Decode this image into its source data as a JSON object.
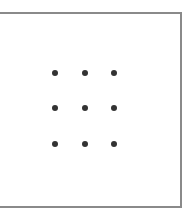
{
  "panel": {
    "border_color": "#8a8a8a",
    "background": "#ffffff"
  },
  "grid": {
    "rows": 3,
    "cols": 3,
    "dot_color": "#333333",
    "dots": [
      {
        "row": 0,
        "col": 0,
        "x": 55,
        "y": 73
      },
      {
        "row": 0,
        "col": 1,
        "x": 85,
        "y": 73
      },
      {
        "row": 0,
        "col": 2,
        "x": 114,
        "y": 73
      },
      {
        "row": 1,
        "col": 0,
        "x": 55,
        "y": 108
      },
      {
        "row": 1,
        "col": 1,
        "x": 85,
        "y": 108
      },
      {
        "row": 1,
        "col": 2,
        "x": 114,
        "y": 108
      },
      {
        "row": 2,
        "col": 0,
        "x": 55,
        "y": 144
      },
      {
        "row": 2,
        "col": 1,
        "x": 85,
        "y": 144
      },
      {
        "row": 2,
        "col": 2,
        "x": 114,
        "y": 144
      }
    ]
  }
}
